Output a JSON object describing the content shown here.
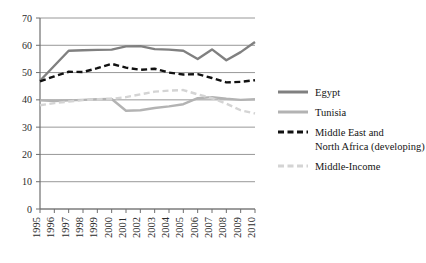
{
  "chart_data": {
    "type": "line",
    "title": "",
    "subtitle": "",
    "xlabel": "",
    "ylabel": "",
    "xlim": [
      1995,
      2010
    ],
    "ylim": [
      0,
      70
    ],
    "ytick_step": 10,
    "grid": true,
    "legend_position": "right",
    "x": [
      1995,
      1996,
      1997,
      1998,
      1999,
      2000,
      2001,
      2002,
      2003,
      2004,
      2005,
      2006,
      2007,
      2008,
      2009,
      2010
    ],
    "xtick_labels": [
      "1995",
      "1996",
      "1997",
      "1998",
      "1999",
      "2000",
      "2001",
      "2002",
      "2003",
      "2004",
      "2005",
      "2006",
      "2007",
      "2008",
      "2009",
      "2010"
    ],
    "ytick_labels": [
      "0",
      "10",
      "20",
      "30",
      "40",
      "50",
      "60",
      "70"
    ],
    "ytick_values": [
      0,
      10,
      20,
      30,
      40,
      50,
      60,
      70
    ],
    "series": [
      {
        "name": "Egypt",
        "color": "#808080",
        "dash": "solid",
        "width": 2.4,
        "values": [
          47.0,
          52.5,
          58.0,
          58.2,
          58.3,
          58.4,
          59.6,
          59.7,
          58.6,
          58.4,
          58.0,
          55.0,
          58.5,
          54.5,
          57.5,
          61.2
        ]
      },
      {
        "name": "Tunisia",
        "color": "#b3b3b3",
        "dash": "solid",
        "width": 2.4,
        "values": [
          39.8,
          39.6,
          39.8,
          40.0,
          40.2,
          40.3,
          36.0,
          36.2,
          37.0,
          37.6,
          38.4,
          40.6,
          41.0,
          40.4,
          40.0,
          40.2
        ]
      },
      {
        "name": "Middle East and North Africa (developing)",
        "color": "#111111",
        "dash": "dashed",
        "width": 2.4,
        "values": [
          46.8,
          48.6,
          50.3,
          50.2,
          51.6,
          53.2,
          51.8,
          51.0,
          51.4,
          50.0,
          49.3,
          49.4,
          48.0,
          46.4,
          46.6,
          47.2
        ]
      },
      {
        "name": "Middle-Income",
        "color": "#d4d4d4",
        "dash": "dashed",
        "width": 2.4,
        "values": [
          38.0,
          38.8,
          39.4,
          39.9,
          40.2,
          40.4,
          41.0,
          42.0,
          43.0,
          43.4,
          43.6,
          42.0,
          40.6,
          38.6,
          36.2,
          35.0
        ]
      }
    ]
  },
  "legend": {
    "items": [
      {
        "label": "Egypt"
      },
      {
        "label": "Tunisia"
      },
      {
        "label": "Middle East and"
      },
      {
        "label": "North Africa (developing)"
      },
      {
        "label": "Middle-Income"
      }
    ]
  },
  "colors": {
    "egypt": "#808080",
    "tunisia": "#b3b3b3",
    "mena": "#111111",
    "middle_income": "#d4d4d4",
    "grid": "#8c8c8c",
    "axis": "#6e6e6e",
    "background": "#ffffff"
  }
}
